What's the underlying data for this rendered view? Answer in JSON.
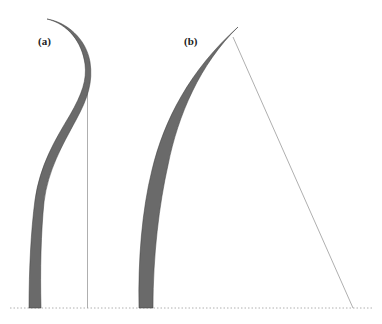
{
  "figure": {
    "panels": [
      {
        "id": "a",
        "label": "(a)",
        "description": "S-shaped bending blade with vertical reference line"
      },
      {
        "id": "b",
        "label": "(b)",
        "description": "Curved blade with inclined straight line from tip to ground"
      }
    ],
    "colors": {
      "blade_fill": "#6a6a6a",
      "blade_stroke": "#3a3a3a",
      "reference_line": "#9a9a9a",
      "ground_line": "#b0b0b0",
      "background": "#ffffff"
    }
  }
}
